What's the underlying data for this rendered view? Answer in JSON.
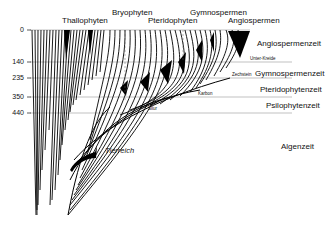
{
  "groups": {
    "thallophyten": "Thallophyten",
    "bryophyten": "Bryophyten",
    "pteridophyten": "Pteridophyten",
    "gymnospermen": "Gymnospermen",
    "angiospermen": "Angiospermen"
  },
  "eras": {
    "angiospermenzeit": "Angiospermenzeit",
    "gymnospermenzeit": "Gymnospermenzeit",
    "pteridophytenzeit": "Pteridophytenzeit",
    "psilophytenzeit": "Psilophytenzeit",
    "algenzeit": "Algenzeit"
  },
  "periods": {
    "unter_kreide": "Unter-Kreide",
    "zechstein": "Zechstein",
    "karbon": "Karbon",
    "silur": "Silur"
  },
  "axis": {
    "ticks": [
      "0",
      "140",
      "235",
      "350",
      "440"
    ]
  },
  "annotations": {
    "tierreich": "Tierreich"
  }
}
